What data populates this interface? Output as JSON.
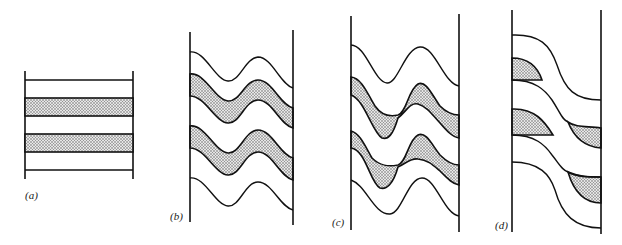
{
  "figure": {
    "panels": [
      {
        "id": "a",
        "label": "(a)",
        "state": "flat horizontal layers, two shaded bands"
      },
      {
        "id": "b",
        "label": "(b)",
        "state": "sinusoidal folding, shaded bands of uniform thickness"
      },
      {
        "id": "c",
        "label": "(c)",
        "state": "sinusoidal folding, shaded bands thickened in hinges and thinned on limbs"
      },
      {
        "id": "d",
        "label": "(d)",
        "state": "sheared step-like folding, shaded bands isolated into lens-shaped pods"
      }
    ],
    "colors": {
      "line": "#111111",
      "shade_dots": "#555555",
      "background": "#ffffff"
    }
  }
}
